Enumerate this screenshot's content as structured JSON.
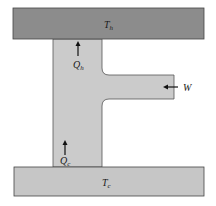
{
  "diagram": {
    "type": "heat-engine-schematic",
    "hot_reservoir": {
      "label": "T",
      "subscript": "h",
      "color": "#8c8c8c"
    },
    "cold_reservoir": {
      "label": "T",
      "subscript": "c",
      "color": "#c6c6c6"
    },
    "engine_body_color": "#cbcbcb",
    "flows": [
      {
        "name": "heat-hot",
        "label": "Q",
        "subscript": "h",
        "direction": "up"
      },
      {
        "name": "heat-cold",
        "label": "Q",
        "subscript": "c",
        "direction": "up"
      },
      {
        "name": "work",
        "label": "W",
        "direction": "left"
      }
    ]
  }
}
